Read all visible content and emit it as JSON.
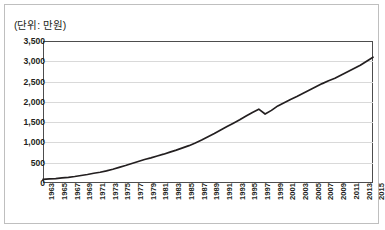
{
  "chart_data": {
    "type": "line",
    "title": "",
    "unit_label": "(단위: 만원)",
    "xlabel": "",
    "ylabel": "",
    "ylim": [
      0,
      3500
    ],
    "ytick_labels": [
      "0",
      "500",
      "1,000",
      "1,500",
      "2,000",
      "2,500",
      "3,000",
      "3,500"
    ],
    "ytick_values": [
      0,
      500,
      1000,
      1500,
      2000,
      2500,
      3000,
      3500
    ],
    "grid": true,
    "legend": "none",
    "xtick_labels": [
      "1963",
      "1965",
      "1967",
      "1969",
      "1971",
      "1973",
      "1975",
      "1977",
      "1979",
      "1981",
      "1983",
      "1985",
      "1987",
      "1989",
      "1991",
      "1993",
      "1995",
      "1997",
      "1999",
      "2001",
      "2003",
      "2005",
      "2007",
      "2009",
      "2011",
      "2013",
      "2015"
    ],
    "x": [
      1963,
      1964,
      1965,
      1966,
      1967,
      1968,
      1969,
      1970,
      1971,
      1972,
      1973,
      1974,
      1975,
      1976,
      1977,
      1978,
      1979,
      1980,
      1981,
      1982,
      1983,
      1984,
      1985,
      1986,
      1987,
      1988,
      1989,
      1990,
      1991,
      1992,
      1993,
      1994,
      1995,
      1996,
      1997,
      1998,
      1999,
      2000,
      2001,
      2002,
      2003,
      2004,
      2005,
      2006,
      2007,
      2008,
      2009,
      2010,
      2011,
      2012,
      2013,
      2014,
      2015
    ],
    "values": [
      90,
      100,
      110,
      125,
      140,
      160,
      185,
      210,
      240,
      265,
      300,
      340,
      385,
      430,
      480,
      530,
      580,
      620,
      665,
      710,
      760,
      810,
      865,
      920,
      985,
      1060,
      1140,
      1220,
      1305,
      1390,
      1475,
      1560,
      1650,
      1740,
      1820,
      1700,
      1790,
      1900,
      1980,
      2060,
      2130,
      2210,
      2290,
      2370,
      2450,
      2520,
      2580,
      2660,
      2740,
      2820,
      2900,
      3000,
      3100
    ],
    "series_color": "#231f20",
    "grid_color": "#d9d9d9",
    "axis_color": "#4d4d4d",
    "annotations": []
  }
}
